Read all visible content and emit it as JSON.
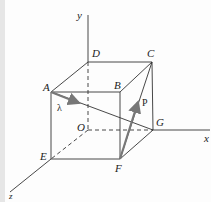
{
  "diagram": {
    "type": "cube-vector-diagram",
    "colors": {
      "line": "#333333",
      "vector": "#777777",
      "background": "#fdfdfd"
    },
    "axes": [
      {
        "name": "y",
        "label": "y"
      },
      {
        "name": "x",
        "label": "x"
      },
      {
        "name": "z",
        "label": "z"
      }
    ],
    "vertices": {
      "A": "A",
      "B": "B",
      "C": "C",
      "D": "D",
      "E": "E",
      "F": "F",
      "G": "G",
      "O": "O"
    },
    "vectors": [
      {
        "name": "lambda",
        "label": "λ",
        "from": "A",
        "direction": "G"
      },
      {
        "name": "P",
        "label": "P",
        "from": "F",
        "direction": "C"
      }
    ]
  }
}
